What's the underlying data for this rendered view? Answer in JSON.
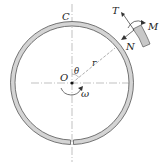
{
  "diagram": {
    "labels": {
      "C": "C",
      "O": "O",
      "theta": "θ",
      "r": "r",
      "omega": "ω",
      "T": "T",
      "M": "M",
      "N": "N"
    },
    "colors": {
      "ring_fill": "#d4d4d4",
      "ring_stroke": "#555555",
      "line": "#888888",
      "text": "#222222"
    }
  }
}
